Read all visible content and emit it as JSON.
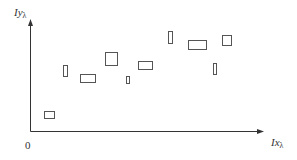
{
  "diagram": {
    "axes": {
      "x_label_main": "Ix",
      "x_label_sub": "λ",
      "y_label_main": "Iy",
      "y_label_sub": "λ",
      "origin_label": "0",
      "origin": [
        30,
        131
      ],
      "x_end": 264,
      "y_end": 19,
      "color": "#333333"
    },
    "boxes": [
      {
        "id": "box-1",
        "x": 44,
        "y": 111,
        "w": 10,
        "h": 7
      },
      {
        "id": "box-2",
        "x": 63,
        "y": 65,
        "w": 4,
        "h": 11
      },
      {
        "id": "box-3",
        "x": 80,
        "y": 74,
        "w": 15,
        "h": 8
      },
      {
        "id": "box-4",
        "x": 105,
        "y": 52,
        "w": 12,
        "h": 13
      },
      {
        "id": "box-5",
        "x": 126,
        "y": 76,
        "w": 3,
        "h": 7
      },
      {
        "id": "box-6",
        "x": 138,
        "y": 61,
        "w": 14,
        "h": 8
      },
      {
        "id": "box-7",
        "x": 168,
        "y": 31,
        "w": 4,
        "h": 12
      },
      {
        "id": "box-8",
        "x": 188,
        "y": 40,
        "w": 18,
        "h": 9
      },
      {
        "id": "box-9",
        "x": 213,
        "y": 63,
        "w": 3,
        "h": 11
      },
      {
        "id": "box-10",
        "x": 222,
        "y": 35,
        "w": 9,
        "h": 10
      }
    ],
    "box_stroke": "#555555"
  }
}
